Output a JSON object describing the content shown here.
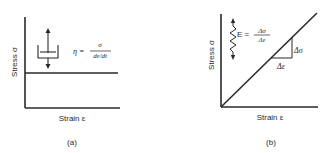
{
  "panels": [
    {
      "id": "a",
      "caption": "(a)",
      "ylabel": "Stress σ",
      "xlabel": "Strain ε",
      "element": "dashpot",
      "equation": {
        "lhs": "η =",
        "numerator": "σ",
        "denominator": "dε/dt"
      },
      "curve": "constant stress (horizontal line)"
    },
    {
      "id": "b",
      "caption": "(b)",
      "ylabel": "Stress σ",
      "xlabel": "Strain ε",
      "element": "spring",
      "equation": {
        "lhs": "E =",
        "numerator": "Δσ",
        "denominator": "Δε"
      },
      "curve": "linear stress-strain line through origin",
      "slope_labels": {
        "rise": "Δσ",
        "run": "Δε"
      }
    }
  ],
  "colors": {
    "ink": "#2a2a2a",
    "background": "#ffffff"
  }
}
